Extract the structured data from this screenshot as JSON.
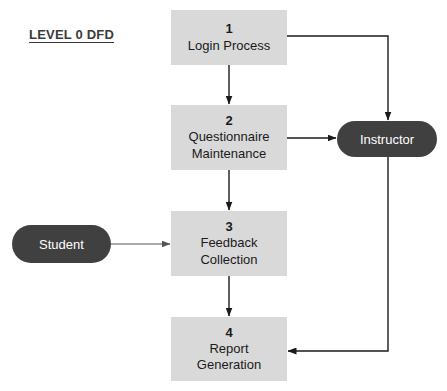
{
  "diagram": {
    "title": "LEVEL 0 DFD",
    "type": "data-flow-diagram",
    "background_color": "#ffffff",
    "process_fill_color": "#d9d9d9",
    "entity_fill_color": "#404040",
    "entity_text_color": "#ffffff",
    "edge_color": "#1a1a1a",
    "processes": [
      {
        "id": "1",
        "label": "Login Process",
        "x": 171,
        "y": 10,
        "w": 116,
        "h": 55
      },
      {
        "id": "2",
        "label": "Questionnaire\nMaintenance",
        "x": 171,
        "y": 105,
        "w": 116,
        "h": 65
      },
      {
        "id": "3",
        "label": "Feedback\nCollection",
        "x": 171,
        "y": 211,
        "w": 116,
        "h": 65
      },
      {
        "id": "4",
        "label": "Report\nGeneration",
        "x": 171,
        "y": 317,
        "w": 116,
        "h": 64
      }
    ],
    "entities": [
      {
        "name": "Instructor",
        "label": "Instructor",
        "x": 337,
        "y": 121,
        "w": 100,
        "h": 36
      },
      {
        "name": "Student",
        "label": "Student",
        "x": 12,
        "y": 225,
        "w": 99,
        "h": 38
      }
    ],
    "flows": [
      {
        "name": "login-to-questionnaire",
        "from": "1",
        "to": "2"
      },
      {
        "name": "questionnaire-to-feedback",
        "from": "2",
        "to": "3"
      },
      {
        "name": "feedback-to-report",
        "from": "3",
        "to": "4"
      },
      {
        "name": "login-to-instructor",
        "from": "1",
        "to": "Instructor"
      },
      {
        "name": "questionnaire-to-instructor",
        "from": "2",
        "to": "Instructor"
      },
      {
        "name": "student-to-feedback",
        "from": "Student",
        "to": "3"
      },
      {
        "name": "instructor-to-report",
        "from": "Instructor",
        "to": "4"
      }
    ]
  }
}
